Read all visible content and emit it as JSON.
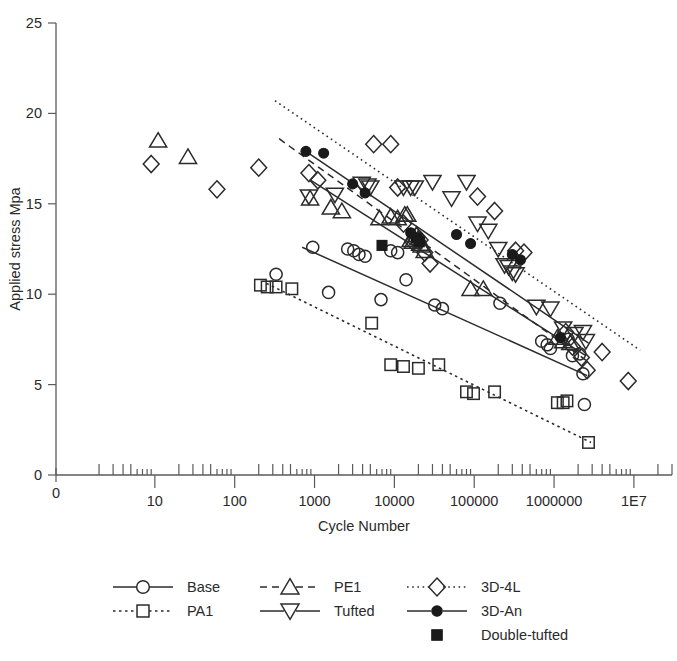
{
  "chart_data": {
    "type": "scatter",
    "title": "",
    "xlabel": "Cycle Number",
    "ylabel": "Applied stress Mpa",
    "xscale": "log",
    "yscale": "linear",
    "xlim": [
      1,
      30000000
    ],
    "ylim": [
      0,
      25
    ],
    "xticks": [
      "0",
      "10",
      "100",
      "1000",
      "10000",
      "100000",
      "1000000",
      "1E7"
    ],
    "yticks": [
      "0",
      "5",
      "10",
      "15",
      "20",
      "25"
    ],
    "grid": false,
    "legend_position": "bottom",
    "series": [
      {
        "name": "Base",
        "marker": "open-circle",
        "line": "solid",
        "trendline": {
          "x": [
            700,
            2600000
          ],
          "y": [
            12.6,
            5.5
          ]
        },
        "points": [
          [
            330,
            11.1
          ],
          [
            950,
            12.6
          ],
          [
            1500,
            10.1
          ],
          [
            2600,
            12.5
          ],
          [
            3100,
            12.4
          ],
          [
            3600,
            12.2
          ],
          [
            4300,
            12.1
          ],
          [
            6800,
            9.7
          ],
          [
            9000,
            12.4
          ],
          [
            11000,
            12.3
          ],
          [
            14000,
            10.8
          ],
          [
            32000,
            9.4
          ],
          [
            40000,
            9.2
          ],
          [
            210000,
            9.5
          ],
          [
            700000,
            7.4
          ],
          [
            820000,
            7.2
          ],
          [
            900000,
            7.0
          ],
          [
            1500000,
            7.5
          ],
          [
            1700000,
            6.6
          ],
          [
            2100000,
            6.7
          ],
          [
            2300000,
            5.6
          ],
          [
            2400000,
            3.9
          ]
        ]
      },
      {
        "name": "PA1",
        "marker": "open-square",
        "line": "dotted",
        "trendline": {
          "x": [
            250,
            2900000
          ],
          "y": [
            10.6,
            1.8
          ]
        },
        "points": [
          [
            210,
            10.5
          ],
          [
            255,
            10.4
          ],
          [
            330,
            10.4
          ],
          [
            520,
            10.3
          ],
          [
            5200,
            8.4
          ],
          [
            9000,
            6.1
          ],
          [
            13000,
            6.0
          ],
          [
            20000,
            5.9
          ],
          [
            36000,
            6.1
          ],
          [
            80000,
            4.6
          ],
          [
            98000,
            4.5
          ],
          [
            180000,
            4.6
          ],
          [
            1100000,
            4.0
          ],
          [
            1300000,
            4.0
          ],
          [
            1450000,
            4.1
          ],
          [
            2700000,
            1.8
          ]
        ]
      },
      {
        "name": "PE1",
        "marker": "open-triangle-up",
        "line": "dashed",
        "trendline": {
          "x": [
            360,
            2600000
          ],
          "y": [
            18.6,
            6.3
          ]
        },
        "points": [
          [
            11,
            18.5
          ],
          [
            26,
            17.6
          ],
          [
            880,
            15.3
          ],
          [
            1600,
            14.8
          ],
          [
            2200,
            14.6
          ],
          [
            6500,
            14.2
          ],
          [
            9000,
            14.3
          ],
          [
            11000,
            14.2
          ],
          [
            13500,
            14.4
          ],
          [
            14500,
            14.4
          ],
          [
            16000,
            13.0
          ],
          [
            17000,
            12.9
          ],
          [
            19000,
            13.3
          ],
          [
            20000,
            13.1
          ],
          [
            21000,
            12.8
          ],
          [
            22000,
            12.7
          ],
          [
            24000,
            12.4
          ],
          [
            90000,
            10.3
          ],
          [
            130000,
            10.3
          ],
          [
            1100000,
            7.6
          ],
          [
            1300000,
            7.4
          ],
          [
            1600000,
            7.3
          ]
        ]
      },
      {
        "name": "Tufted",
        "marker": "open-triangle-down",
        "line": "solid",
        "trendline": {
          "x": [
            900,
            2500000
          ],
          "y": [
            16.3,
            6.6
          ]
        },
        "points": [
          [
            850,
            15.4
          ],
          [
            1800,
            15.5
          ],
          [
            3900,
            16.1
          ],
          [
            4600,
            16.0
          ],
          [
            5000,
            15.9
          ],
          [
            13000,
            15.9
          ],
          [
            16000,
            15.9
          ],
          [
            18000,
            15.9
          ],
          [
            30000,
            16.2
          ],
          [
            52000,
            15.3
          ],
          [
            80000,
            16.2
          ],
          [
            110000,
            13.9
          ],
          [
            150000,
            13.5
          ],
          [
            200000,
            12.5
          ],
          [
            240000,
            11.6
          ],
          [
            270000,
            11.5
          ],
          [
            300000,
            11.2
          ],
          [
            330000,
            11.1
          ],
          [
            600000,
            9.3
          ],
          [
            900000,
            9.2
          ],
          [
            1300000,
            8.1
          ],
          [
            1800000,
            7.8
          ],
          [
            2300000,
            7.9
          ],
          [
            2500000,
            7.4
          ]
        ]
      },
      {
        "name": "3D-4L",
        "marker": "open-diamond",
        "line": "fine-dotted",
        "trendline": {
          "x": [
            320,
            12000000
          ],
          "y": [
            20.7,
            6.9
          ]
        },
        "points": [
          [
            9,
            17.2
          ],
          [
            60,
            15.8
          ],
          [
            200,
            17.0
          ],
          [
            850,
            16.7
          ],
          [
            1100,
            16.3
          ],
          [
            5500,
            18.3
          ],
          [
            9000,
            18.3
          ],
          [
            11000,
            15.9
          ],
          [
            13000,
            13.9
          ],
          [
            17000,
            12.9
          ],
          [
            19000,
            13.2
          ],
          [
            21000,
            13.0
          ],
          [
            24000,
            12.3
          ],
          [
            28000,
            11.7
          ],
          [
            110000,
            15.4
          ],
          [
            180000,
            14.6
          ],
          [
            330000,
            12.4
          ],
          [
            420000,
            12.3
          ],
          [
            1400000,
            7.9
          ],
          [
            1700000,
            7.1
          ],
          [
            2200000,
            6.5
          ],
          [
            2600000,
            5.8
          ],
          [
            4000000,
            6.8
          ],
          [
            8500000,
            5.2
          ]
        ]
      },
      {
        "name": "3D-An",
        "marker": "filled-circle",
        "line": "solid",
        "trendline": {
          "x": [
            780,
            2700000
          ],
          "y": [
            17.9,
            7.3
          ]
        },
        "points": [
          [
            780,
            17.9
          ],
          [
            1300,
            17.8
          ],
          [
            3000,
            16.1
          ],
          [
            4300,
            15.6
          ],
          [
            16000,
            13.4
          ],
          [
            19000,
            13.1
          ],
          [
            20500,
            13.0
          ],
          [
            21000,
            12.9
          ],
          [
            60000,
            13.3
          ],
          [
            90000,
            12.8
          ],
          [
            300000,
            12.2
          ],
          [
            380000,
            11.9
          ],
          [
            1200000,
            7.6
          ]
        ]
      },
      {
        "name": "Double-tufted",
        "marker": "filled-square",
        "line": "none",
        "points": [
          [
            7000,
            12.7
          ],
          [
            19000,
            13.1
          ],
          [
            20500,
            12.9
          ]
        ]
      }
    ]
  },
  "legend": {
    "entries": [
      {
        "label": "Base",
        "marker": "open-circle",
        "line": "solid"
      },
      {
        "label": "PE1",
        "marker": "open-triangle-up",
        "line": "dashed"
      },
      {
        "label": "3D-4L",
        "marker": "open-diamond",
        "line": "fine-dotted"
      },
      {
        "label": "PA1",
        "marker": "open-square",
        "line": "dotted"
      },
      {
        "label": "Tufted",
        "marker": "open-triangle-down",
        "line": "solid"
      },
      {
        "label": "3D-An",
        "marker": "filled-circle",
        "line": "solid"
      },
      {
        "label": "Double-tufted",
        "marker": "filled-square",
        "line": "none"
      }
    ]
  },
  "colors": {
    "ink": "#2b2b2b",
    "axis": "#5a5a5a",
    "background": "#ffffff"
  }
}
